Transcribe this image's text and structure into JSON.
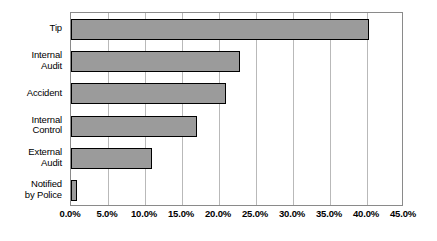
{
  "chart_data": {
    "type": "bar",
    "orientation": "horizontal",
    "title": "",
    "xlabel": "",
    "ylabel": "",
    "categories": [
      "Tip",
      "Internal Audit",
      "Accident",
      "Internal Control",
      "External Audit",
      "Notified by Police"
    ],
    "category_lines": [
      [
        "Tip"
      ],
      [
        "Internal",
        "Audit"
      ],
      [
        "Accident"
      ],
      [
        "Internal",
        "Control"
      ],
      [
        "External",
        "Audit"
      ],
      [
        "Notified",
        "by Police"
      ]
    ],
    "values": [
      40.3,
      22.9,
      21.0,
      17.0,
      11.0,
      0.8
    ],
    "value_labels": [
      "40.3%",
      "22.9%",
      "21.0%",
      "17.0%",
      "11.0%",
      "0.8%"
    ],
    "xlim": [
      0,
      45
    ],
    "xtick_values": [
      0,
      5,
      10,
      15,
      20,
      25,
      30,
      35,
      40,
      45
    ],
    "xtick_labels": [
      "0.0%",
      "5.0%",
      "10.0%",
      "15.0%",
      "20.0%",
      "25.0%",
      "30.0%",
      "35.0%",
      "40.0%",
      "45.0%"
    ],
    "grid": "vertical",
    "legend": "none",
    "bar_fill_color": "#9b9b9b",
    "bar_border_color": "#000000",
    "gridline_color": "#b9b9b9",
    "frame_color": "#8a8a8a",
    "background_color": "#ffffff"
  }
}
